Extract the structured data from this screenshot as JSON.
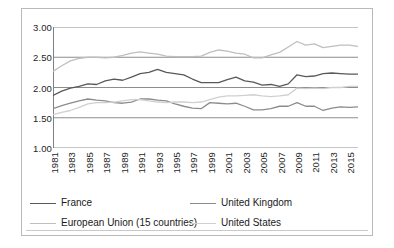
{
  "chart_data": {
    "type": "line",
    "title": "",
    "subtitle": "",
    "xlabel": "",
    "ylabel": "",
    "xlim": [
      1981,
      2016
    ],
    "ylim": [
      1.0,
      3.0
    ],
    "ytick_step": 0.5,
    "grid": "horizontal",
    "legend_position": "bottom",
    "ytick_labels": [
      "3.00",
      "2.50",
      "2.00",
      "1.50",
      "1.00"
    ],
    "ytick_values": [
      3.0,
      2.5,
      2.0,
      1.5,
      1.0
    ],
    "x": [
      1981,
      1982,
      1983,
      1984,
      1985,
      1986,
      1987,
      1988,
      1989,
      1990,
      1991,
      1992,
      1993,
      1994,
      1995,
      1996,
      1997,
      1998,
      1999,
      2000,
      2001,
      2002,
      2003,
      2004,
      2005,
      2006,
      2007,
      2008,
      2009,
      2010,
      2011,
      2012,
      2013,
      2014,
      2015,
      2016
    ],
    "xtick_labels": [
      "1981",
      "1983",
      "1985",
      "1987",
      "1989",
      "1991",
      "1993",
      "1995",
      "1997",
      "1999",
      "2001",
      "2003",
      "2005",
      "2007",
      "2009",
      "2011",
      "2013",
      "2015"
    ],
    "xtick_label_values": [
      1981,
      1983,
      1985,
      1987,
      1989,
      1991,
      1993,
      1995,
      1997,
      1999,
      2001,
      2003,
      2005,
      2007,
      2009,
      2011,
      2013,
      2015
    ],
    "series": [
      {
        "name": "France",
        "color": "#595959",
        "values": [
          1.87,
          1.94,
          1.99,
          2.02,
          2.06,
          2.05,
          2.11,
          2.14,
          2.12,
          2.17,
          2.23,
          2.25,
          2.3,
          2.25,
          2.23,
          2.21,
          2.14,
          2.08,
          2.08,
          2.08,
          2.13,
          2.17,
          2.11,
          2.09,
          2.04,
          2.05,
          2.02,
          2.06,
          2.21,
          2.18,
          2.19,
          2.23,
          2.24,
          2.23,
          2.22,
          2.22
        ]
      },
      {
        "name": "United Kingdom",
        "color": "#8c8c8c",
        "values": [
          1.65,
          1.7,
          1.74,
          1.78,
          1.81,
          1.79,
          1.78,
          1.75,
          1.74,
          1.76,
          1.81,
          1.81,
          1.79,
          1.78,
          1.73,
          1.69,
          1.66,
          1.65,
          1.75,
          1.74,
          1.73,
          1.74,
          1.69,
          1.63,
          1.63,
          1.65,
          1.69,
          1.69,
          1.75,
          1.69,
          1.69,
          1.62,
          1.66,
          1.68,
          1.67,
          1.68
        ]
      },
      {
        "name": "European Union (15 countries)",
        "color": "#bfbfbf",
        "values": [
          2.27,
          2.36,
          2.44,
          2.48,
          2.5,
          2.5,
          2.49,
          2.5,
          2.53,
          2.57,
          2.59,
          2.57,
          2.55,
          2.52,
          2.51,
          2.51,
          2.51,
          2.52,
          2.58,
          2.62,
          2.6,
          2.57,
          2.55,
          2.49,
          2.49,
          2.54,
          2.58,
          2.67,
          2.76,
          2.7,
          2.72,
          2.66,
          2.68,
          2.7,
          2.7,
          2.68
        ]
      },
      {
        "name": "United States",
        "color": "#d0d0d0",
        "values": [
          1.55,
          1.59,
          1.62,
          1.67,
          1.73,
          1.75,
          1.75,
          1.76,
          1.78,
          1.8,
          1.8,
          1.78,
          1.76,
          1.75,
          1.76,
          1.76,
          1.75,
          1.76,
          1.8,
          1.84,
          1.86,
          1.86,
          1.87,
          1.88,
          1.86,
          1.85,
          1.86,
          1.88,
          1.99,
          1.98,
          1.99,
          1.98,
          2.0,
          2.0,
          2.02,
          2.02
        ]
      }
    ]
  },
  "legend": {
    "items": [
      {
        "label": "France"
      },
      {
        "label": "United Kingdom"
      },
      {
        "label": "European Union (15 countries)"
      },
      {
        "label": "United States"
      }
    ]
  }
}
